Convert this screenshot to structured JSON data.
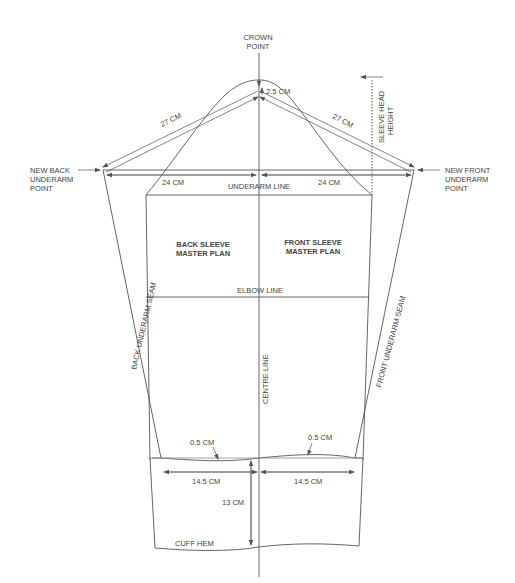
{
  "diagram": {
    "labels": {
      "crown_point_1": "CROWN",
      "crown_point_2": "POINT",
      "crown_drop": "2.5 CM",
      "back_diag": "27 CM",
      "front_diag": "27 CM",
      "sleeve_head_1": "SLEEVE HEAD",
      "sleeve_head_2": "HEIGHT",
      "new_back_1": "NEW BACK",
      "new_back_2": "UNDERARM",
      "new_back_3": "POINT",
      "new_front_1": "NEW FRONT",
      "new_front_2": "UNDERARM",
      "new_front_3": "POINT",
      "back_half_width": "24 CM",
      "front_half_width": "24 CM",
      "underarm_line": "UNDERARM  LINE",
      "back_plan_1": "BACK SLEEVE",
      "back_plan_2": "MASTER PLAN",
      "front_plan_1": "FRONT SLEEVE",
      "front_plan_2": "MASTER PLAN",
      "elbow_line": "ELBOW LINE",
      "back_seam": "BACK UNDERARM SEAM",
      "front_seam": "FRONT UNDERARM  SEAM",
      "centre_line": "CENTRE LINE",
      "back_curve": "0.5 CM",
      "front_curve": "0.5 CM",
      "back_wrist": "14.5 CM",
      "front_wrist": "14.5 CM",
      "cuff_depth": "13 CM",
      "cuff_hem": "CUFF HEM"
    },
    "colors": {
      "line": "#555555",
      "text": "#444444",
      "background": "#ffffff"
    }
  }
}
